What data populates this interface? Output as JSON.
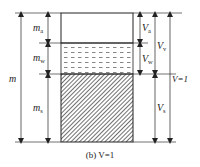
{
  "diagram": {
    "type": "three-phase soil diagram",
    "phases": [
      {
        "name": "air",
        "fill": "blank"
      },
      {
        "name": "water",
        "fill": "dashes"
      },
      {
        "name": "solid",
        "fill": "hatch"
      }
    ],
    "left_labels": {
      "total": "m",
      "air": {
        "base": "m",
        "sub": "a"
      },
      "water": {
        "base": "m",
        "sub": "w"
      },
      "solid": {
        "base": "m",
        "sub": "s"
      }
    },
    "right_labels": {
      "air": {
        "base": "V",
        "sub": "a"
      },
      "water": {
        "base": "V",
        "sub": "w"
      },
      "voids": {
        "base": "V",
        "sub": "v"
      },
      "solid": {
        "base": "V",
        "sub": "s"
      },
      "total": "V=1"
    },
    "caption": "(b) V=1",
    "colors": {
      "line": "#333333",
      "hatch": "#444444"
    }
  }
}
